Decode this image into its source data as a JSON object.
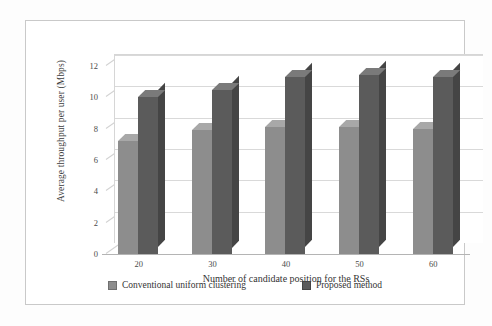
{
  "chart_data": {
    "type": "bar",
    "title": "",
    "xlabel": "Number of candidate position for the RSs",
    "ylabel": "Average throughput per user (Mbps)",
    "categories": [
      "20",
      "30",
      "40",
      "50",
      "60"
    ],
    "ylim": [
      0,
      12
    ],
    "yticks": [
      "0",
      "2",
      "4",
      "6",
      "8",
      "10",
      "12"
    ],
    "grid": true,
    "legend_position": "bottom",
    "series": [
      {
        "name": "Conventional uniform clustering",
        "color": "#8d8d8d",
        "values": [
          7.2,
          7.9,
          8.1,
          8.1,
          8.0
        ]
      },
      {
        "name": "Proposed method",
        "color": "#5b5b5b",
        "values": [
          10.0,
          10.5,
          11.3,
          11.4,
          11.3
        ]
      }
    ]
  }
}
